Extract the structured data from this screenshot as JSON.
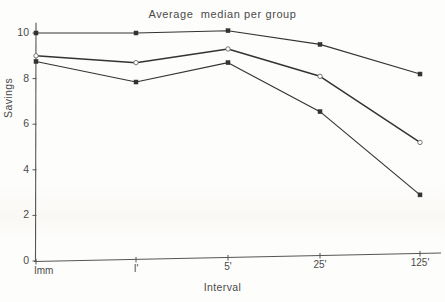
{
  "chart_data": {
    "type": "line",
    "title": "Average  median per group",
    "xlabel": "Interval",
    "ylabel": "Savings",
    "categories": [
      "Imm",
      "I'",
      "5'",
      "25'",
      "125'"
    ],
    "ylim": [
      0,
      10.6
    ],
    "yticks": [
      0,
      2,
      4,
      6,
      8,
      10
    ],
    "ytick_labels": [
      "0",
      "2",
      "4",
      "6",
      "8",
      "10"
    ],
    "grid": false,
    "legend": "none",
    "series": [
      {
        "name": "top-curve",
        "marker": "filled-square",
        "values": [
          10.0,
          10.0,
          10.1,
          9.5,
          8.2
        ]
      },
      {
        "name": "middle-curve",
        "marker": "open-circle",
        "values": [
          9.0,
          8.7,
          9.3,
          8.1,
          5.2
        ]
      },
      {
        "name": "lower-curve",
        "marker": "filled-square",
        "values": [
          8.75,
          7.85,
          8.7,
          6.55,
          2.9
        ]
      }
    ]
  },
  "axes": {
    "x_positions": [
      36,
      136,
      228,
      320,
      420
    ],
    "origin": {
      "x": 36,
      "y": 261
    },
    "y_top": 33,
    "y_bottom": 261,
    "x_right": 441
  },
  "colors": {
    "ink": "#333333",
    "ink_light": "#555555",
    "background": "#fdfdfc"
  }
}
